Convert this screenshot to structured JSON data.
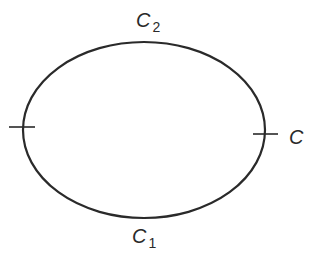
{
  "diagram": {
    "curve": {
      "shape": "ellipse",
      "cx": 144,
      "cy": 130,
      "rx": 121,
      "ry": 88,
      "stroke": "#2a2a2a",
      "stroke_width": 2.2
    },
    "ticks": [
      {
        "name": "left-point-tick",
        "x1": 9,
        "y1": 127,
        "x2": 35,
        "y2": 127
      },
      {
        "name": "right-point-tick",
        "x1": 253,
        "y1": 134,
        "x2": 278,
        "y2": 134
      }
    ],
    "labels": {
      "upper": {
        "base": "C",
        "sub": "2"
      },
      "right": {
        "base": "C",
        "sub": ""
      },
      "lower": {
        "base": "C",
        "sub": "1"
      }
    }
  }
}
